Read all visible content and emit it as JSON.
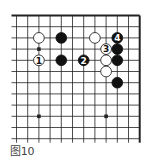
{
  "figure": {
    "caption": "图10",
    "colors": {
      "line": "#222222",
      "black_stone": "#111111",
      "white_stone": "#ffffff",
      "background": "#ffffff"
    }
  },
  "board": {
    "origin_x": 16.5,
    "origin_y": 15.5,
    "spacing": 11.2,
    "cols": 12,
    "rows": 12,
    "top_edge": true,
    "right_edge": true,
    "star_points": [
      [
        2,
        3
      ],
      [
        2,
        9
      ],
      [
        8,
        9
      ]
    ],
    "stones": [
      {
        "color": "white",
        "col": 2,
        "row": 2,
        "label": ""
      },
      {
        "color": "black",
        "col": 4,
        "row": 2,
        "label": ""
      },
      {
        "color": "white",
        "col": 7,
        "row": 2,
        "label": ""
      },
      {
        "color": "black",
        "col": 9,
        "row": 2,
        "label": "4"
      },
      {
        "color": "white",
        "col": 8,
        "row": 3,
        "label": "3"
      },
      {
        "color": "black",
        "col": 9,
        "row": 3,
        "label": ""
      },
      {
        "color": "white",
        "col": 2,
        "row": 4,
        "label": "1"
      },
      {
        "color": "black",
        "col": 4,
        "row": 4,
        "label": ""
      },
      {
        "color": "black",
        "col": 6,
        "row": 4,
        "label": "2"
      },
      {
        "color": "white",
        "col": 8,
        "row": 4,
        "label": ""
      },
      {
        "color": "black",
        "col": 9,
        "row": 4,
        "label": ""
      },
      {
        "color": "white",
        "col": 8,
        "row": 5,
        "label": ""
      },
      {
        "color": "black",
        "col": 9,
        "row": 6,
        "label": ""
      }
    ]
  }
}
